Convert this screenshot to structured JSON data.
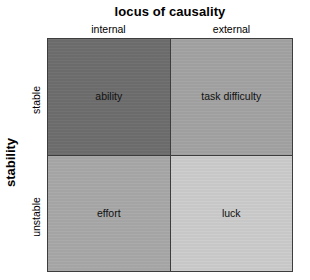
{
  "chart_data": {
    "type": "table",
    "xlabel": "locus of causality",
    "ylabel": "stability",
    "x_categories": [
      "internal",
      "external"
    ],
    "y_categories": [
      "stable",
      "unstable"
    ],
    "cells": [
      {
        "row": "stable",
        "column": "internal",
        "label": "ability",
        "fill": "#6e6e6e"
      },
      {
        "row": "stable",
        "column": "external",
        "label": "task difficulty",
        "fill": "#a3a3a3"
      },
      {
        "row": "unstable",
        "column": "internal",
        "label": "effort",
        "fill": "#a8a8a8"
      },
      {
        "row": "unstable",
        "column": "external",
        "label": "luck",
        "fill": "#cccccc"
      }
    ],
    "grid": true,
    "legend": "none",
    "border_color": "#3d3d3d",
    "background": "#ffffff"
  }
}
